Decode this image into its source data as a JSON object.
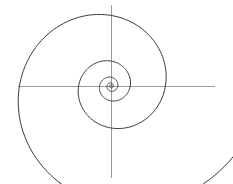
{
  "figure": {
    "background_color": "#ffffff",
    "width": 233,
    "height": 184
  },
  "axes": {
    "origin": {
      "x": 111,
      "y": 86
    },
    "x_axis": {
      "label": "x-axis",
      "x1": 18,
      "y1": 86,
      "x2": 215,
      "y2": 86,
      "color": "#9a9a9a",
      "stroke_width": 1
    },
    "y_axis": {
      "label": "y-axis",
      "x1": 111,
      "y1": 5,
      "x2": 111,
      "y2": 178,
      "color": "#9a9a9a",
      "stroke_width": 1
    }
  },
  "chart_data": {
    "type": "line",
    "xlabel": "",
    "ylabel": "",
    "grid": false,
    "legend": null,
    "curve": {
      "name": "logarithmic spiral",
      "equation": "r = a * e^(b * theta)",
      "a": 0.85,
      "b": 0.1655,
      "theta_start": 0.0,
      "theta_end": 34.56,
      "direction": "counterclockwise",
      "turns": 5.5,
      "color": "#3a3a3a",
      "stroke_width": 1,
      "center": {
        "x": 111,
        "y": 86
      },
      "extents": {
        "left": 50,
        "right": 210,
        "top": 41,
        "bottom": 165
      },
      "endpoint": {
        "x": 210,
        "y": 86
      },
      "sample_step_rad": 0.05
    }
  }
}
